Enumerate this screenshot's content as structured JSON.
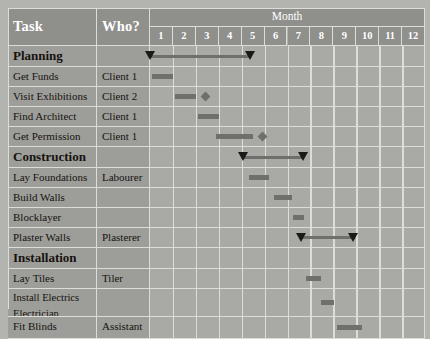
{
  "header": {
    "task_label": "Task",
    "who_label": "Who?",
    "month_label": "Month",
    "months": [
      "1",
      "2",
      "3",
      "4",
      "5",
      "6",
      "7",
      "8",
      "9",
      "10",
      "11",
      "12"
    ]
  },
  "colors": {
    "page_background": "#b3b3b0",
    "header_fill": "#8f8f8c",
    "label_fill": "#9d9d99",
    "grid_fill": "#a9a9a5",
    "gridline": "#dcdcd8",
    "bar": "#6f6f6c",
    "marker": "#1a1a18",
    "header_text": "#ffffff",
    "body_text": "#16130f"
  },
  "chart_data": {
    "type": "gantt",
    "title": "Month",
    "xlabel": "Month",
    "ylabel": "Task",
    "xlim": [
      1,
      13
    ],
    "grid": true,
    "categories": [
      "1",
      "2",
      "3",
      "4",
      "5",
      "6",
      "7",
      "8",
      "9",
      "10",
      "11",
      "12"
    ],
    "rows": [
      {
        "task": "Planning",
        "who": "",
        "kind": "summary",
        "start": 1.0,
        "end": 5.4,
        "milestone": null
      },
      {
        "task": "Get Funds",
        "who": "Client 1",
        "kind": "task",
        "start": 1.1,
        "end": 2.0,
        "milestone": null
      },
      {
        "task": "Visit Exhibitions",
        "who": "Client 2",
        "kind": "task",
        "start": 2.1,
        "end": 3.0,
        "milestone": 3.4
      },
      {
        "task": "Find Architect",
        "who": "Client 1",
        "kind": "task",
        "start": 3.1,
        "end": 4.0,
        "milestone": null
      },
      {
        "task": "Get Permission",
        "who": "Client 1",
        "kind": "task",
        "start": 3.9,
        "end": 5.5,
        "milestone": 5.9
      },
      {
        "task": "Construction",
        "who": "",
        "kind": "summary",
        "start": 5.1,
        "end": 7.7,
        "milestone": null
      },
      {
        "task": "Lay Foundations",
        "who": "Labourer",
        "kind": "task",
        "start": 5.3,
        "end": 6.2,
        "milestone": null
      },
      {
        "task": "Build Walls",
        "who": "",
        "kind": "task",
        "start": 6.4,
        "end": 7.2,
        "milestone": null
      },
      {
        "task": "Blocklayer",
        "who": "",
        "kind": "task",
        "start": 7.2,
        "end": 7.7,
        "milestone": null
      },
      {
        "task": "Plaster Walls",
        "who": "Plasterer",
        "kind": "summary",
        "start": 7.6,
        "end": 9.9,
        "milestone": null
      },
      {
        "task": "Installation",
        "who": "",
        "kind": "summary",
        "start": 0,
        "end": 0,
        "milestone": null
      },
      {
        "task": "Lay Tiles",
        "who": "Tiler",
        "kind": "task",
        "start": 7.8,
        "end": 8.4,
        "milestone": null
      },
      {
        "task": "Install Electrics\nElectrician",
        "who": "",
        "kind": "task",
        "start": 8.4,
        "end": 9.0,
        "milestone": null
      },
      {
        "task": "Fit Blinds",
        "who": "Assistant",
        "kind": "task",
        "start": 9.1,
        "end": 10.2,
        "milestone": null
      }
    ]
  },
  "rows": [
    {
      "task": "Planning",
      "who": "",
      "kind": "summary",
      "height": 21
    },
    {
      "task": "Get Funds",
      "who": "Client 1",
      "kind": "task",
      "height": 20
    },
    {
      "task": "Visit Exhibitions",
      "who": "Client 2",
      "kind": "task",
      "height": 20
    },
    {
      "task": "Find Architect",
      "who": "Client 1",
      "kind": "task",
      "height": 20
    },
    {
      "task": "Get Permission",
      "who": "Client 1",
      "kind": "task",
      "height": 20
    },
    {
      "task": "Construction",
      "who": "",
      "kind": "summary",
      "height": 21
    },
    {
      "task": "Lay Foundations",
      "who": "Labourer",
      "kind": "task",
      "height": 20
    },
    {
      "task": "Build Walls",
      "who": "",
      "kind": "task",
      "height": 20
    },
    {
      "task": "Blocklayer",
      "who": "",
      "kind": "task",
      "height": 20
    },
    {
      "task": "Plaster Walls",
      "who": "Plasterer",
      "kind": "task",
      "height": 20
    },
    {
      "task": "Installation",
      "who": "",
      "kind": "summary",
      "height": 21
    },
    {
      "task": "Lay Tiles",
      "who": "Tiler",
      "kind": "task",
      "height": 20
    },
    {
      "task": "Install Electrics",
      "task2": "Electrician",
      "who": "",
      "kind": "twoline",
      "height": 28
    },
    {
      "task": "Fit Blinds",
      "who": "Assistant",
      "kind": "task",
      "height": 22
    }
  ],
  "bars": [
    {
      "row": 0,
      "style": "sum",
      "start": 1.0,
      "end": 5.4,
      "tri_start": true,
      "tri_end": true
    },
    {
      "row": 1,
      "style": "task",
      "start": 1.1,
      "end": 2.0
    },
    {
      "row": 2,
      "style": "task",
      "start": 2.1,
      "end": 3.0,
      "diamond": 3.4
    },
    {
      "row": 3,
      "style": "task",
      "start": 3.1,
      "end": 4.0
    },
    {
      "row": 4,
      "style": "task",
      "start": 3.9,
      "end": 5.5,
      "diamond": 5.9
    },
    {
      "row": 5,
      "style": "sum",
      "start": 5.1,
      "end": 7.7,
      "tri_start": true,
      "tri_end": true
    },
    {
      "row": 6,
      "style": "task",
      "start": 5.3,
      "end": 6.2
    },
    {
      "row": 7,
      "style": "task",
      "start": 6.4,
      "end": 7.2
    },
    {
      "row": 8,
      "style": "task",
      "start": 7.25,
      "end": 7.7
    },
    {
      "row": 9,
      "style": "sum",
      "start": 7.6,
      "end": 9.9,
      "tri_start": true,
      "tri_end": true
    },
    {
      "row": 11,
      "style": "task",
      "start": 7.8,
      "end": 8.45
    },
    {
      "row": 12,
      "style": "task",
      "start": 8.45,
      "end": 9.05
    },
    {
      "row": 13,
      "style": "task",
      "start": 9.15,
      "end": 10.25
    }
  ]
}
